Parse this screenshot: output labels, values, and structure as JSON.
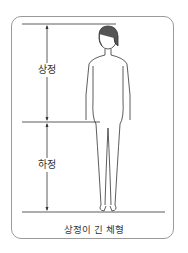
{
  "diagram": {
    "labels": {
      "upper": "상정",
      "lower": "하정"
    },
    "caption": "상정이 긴 체형",
    "colors": {
      "line": "#333333",
      "frame": "#9a9a9a",
      "background": "#ffffff"
    }
  }
}
